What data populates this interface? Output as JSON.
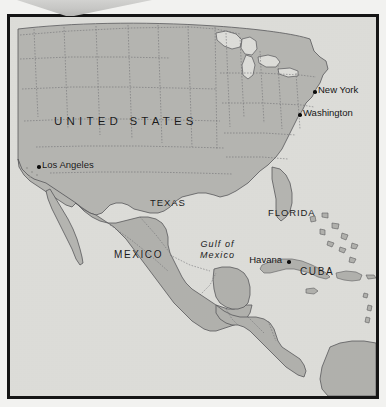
{
  "map": {
    "title": "Map of North America, Gulf of Mexico and the Caribbean",
    "colors": {
      "page_background": "#f2f2f0",
      "frame_border": "#151515",
      "water": "#dcdcd8",
      "land": "#b4b4b0",
      "coastline": "#58585a",
      "state_border": "#6a6a6c",
      "label_text": "#1a1a1a",
      "city_dot": "#0d0d0d",
      "wedge": "#c8c8c6"
    },
    "countries": [
      {
        "name": "UNITED STATES",
        "x": 44,
        "y": 98
      },
      {
        "name": "MEXICO",
        "x": 104,
        "y": 232
      },
      {
        "name": "CUBA",
        "x": 290,
        "y": 249
      }
    ],
    "states": [
      {
        "name": "TEXAS",
        "x": 140,
        "y": 180
      },
      {
        "name": "FLORIDA",
        "x": 258,
        "y": 190
      }
    ],
    "water_bodies": [
      {
        "name_line1": "Gulf of",
        "name_line2": "Mexico",
        "x": 190,
        "y": 222
      }
    ],
    "cities": [
      {
        "name": "New York",
        "x": 303,
        "y": 73,
        "label_side": "right"
      },
      {
        "name": "Washington",
        "x": 288,
        "y": 96,
        "label_side": "right"
      },
      {
        "name": "Los Angeles",
        "x": 27,
        "y": 148,
        "label_side": "right"
      },
      {
        "name": "Havana",
        "x": 277,
        "y": 243,
        "label_side": "left"
      }
    ]
  }
}
